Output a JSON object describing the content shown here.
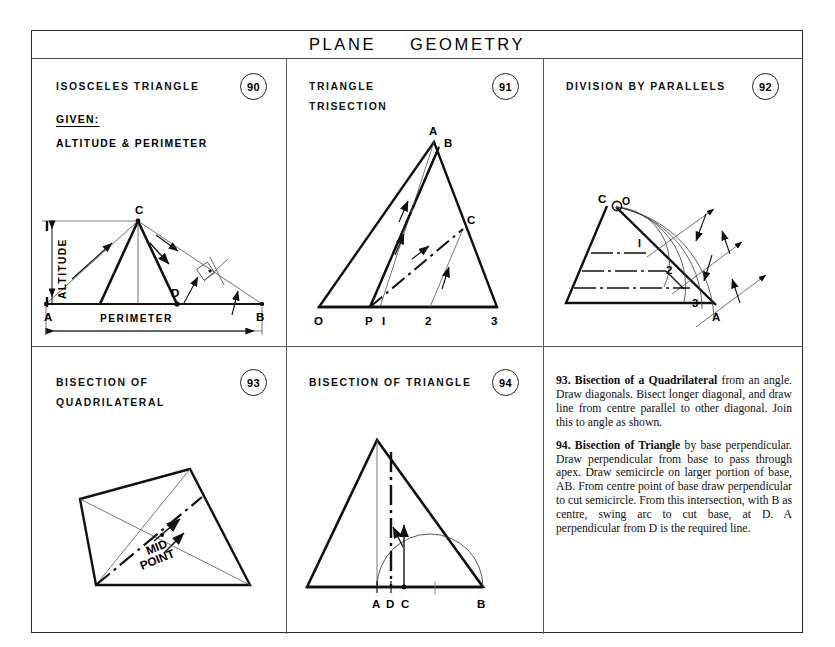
{
  "page": {
    "title_word_1": "PLANE",
    "title_word_2": "GEOMETRY"
  },
  "panels": [
    {
      "id": "p90",
      "number": "90",
      "title_line_1": "ISOSCELES  TRIANGLE",
      "title_line_2": "",
      "given_label": "GIVEN:",
      "given_value": "ALTITUDE  &  PERIMETER",
      "diagram_labels": {
        "apex": "C",
        "foot_d": "D",
        "left_a": "A",
        "right_b": "B",
        "altitude": "ALTITUDE",
        "perimeter": "PERIMETER"
      }
    },
    {
      "id": "p91",
      "number": "91",
      "title_line_1": "TRIANGLE",
      "title_line_2": "TRISECTION",
      "diagram_labels": {
        "apex_a": "A",
        "apex_b": "B",
        "point_c": "C",
        "base_o": "O",
        "base_p": "P",
        "base_1": "I",
        "base_2": "2",
        "base_3": "3"
      }
    },
    {
      "id": "p92",
      "number": "92",
      "title_line_1": "DIVISION  BY  PARALLELS",
      "title_line_2": "",
      "diagram_labels": {
        "vertex_c": "C",
        "centre_o": "O",
        "div_1": "I",
        "div_2": "2",
        "div_3": "3",
        "vertex_a": "A"
      }
    },
    {
      "id": "p93",
      "number": "93",
      "title_line_1": "BISECTION    OF",
      "title_line_2": "QUADRILATERAL",
      "diagram_labels": {
        "mid_line_1": "MID",
        "mid_line_2": "POINT"
      }
    },
    {
      "id": "p94",
      "number": "94",
      "title_line_1": "BISECTION  OF  TRIANGLE",
      "title_line_2": "",
      "diagram_labels": {
        "base_a": "A",
        "base_d": "D",
        "base_c": "C",
        "base_b": "B"
      }
    }
  ],
  "notes": [
    {
      "number": "93.",
      "heading": "Bisection of a Quadrilateral",
      "body": " from an angle. Draw diagonals. Bisect longer diagonal, and draw line from centre parallel to other diagonal. Join this to angle as shown."
    },
    {
      "number": "94.",
      "heading": "Bisection of Triangle",
      "body": " by base perpendicular. Draw perpendicular from base to pass through apex. Draw semicircle on larger portion of base, AB. From centre point of base draw perpendicular to cut semicircle. From this intersection, with B as centre, swing arc to cut base, at D. A perpendicular from D is the required line."
    }
  ],
  "colors": {
    "ink": "#111111",
    "frame": "#2a2a2a",
    "thin": "#555555"
  }
}
